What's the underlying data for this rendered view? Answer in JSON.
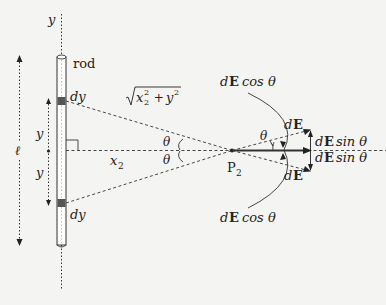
{
  "diagram": {
    "labels": {
      "y_axis": "y",
      "rod": "rod",
      "length": "ℓ",
      "dy_top": "dy",
      "dy_bottom": "dy",
      "y_upper": "y",
      "y_lower": "y",
      "x2": "x",
      "x2_sub": "2",
      "hypotenuse_x": "x",
      "hypotenuse_x_sub": "2",
      "hypotenuse_x_sup": "2",
      "hypotenuse_plus": " + ",
      "hypotenuse_y": "y",
      "hypotenuse_y_sup": "2",
      "theta_upper": "θ",
      "theta_lower": "θ",
      "theta_field": "θ",
      "point": "P",
      "point_sub": "2",
      "dE_upper": "E",
      "dE_lower": "E",
      "d": "d",
      "dE_cos_top": "cos θ",
      "dE_cos_bottom": "cos θ",
      "dE_sin_upper": "sin θ",
      "dE_sin_lower": "sin θ"
    },
    "colors": {
      "ink": "#222222",
      "rod_fill": "#ffffff",
      "dy_fill": "#555555",
      "background": "#f4f4f2"
    }
  }
}
